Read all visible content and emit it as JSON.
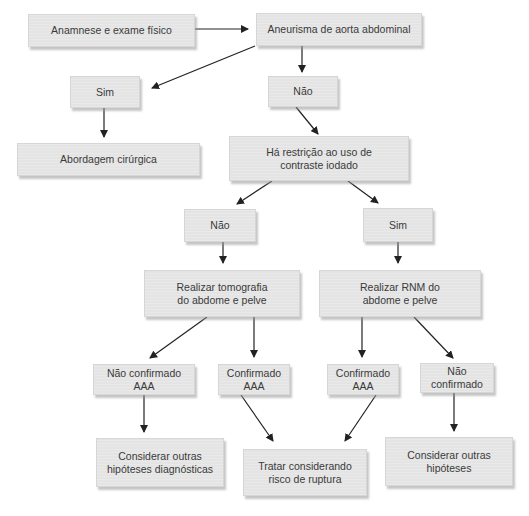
{
  "diagram": {
    "type": "flowchart",
    "language": "pt-BR",
    "nodes": {
      "anamnese": "Anamnese e exame físico",
      "aneurisma": "Aneurisma de aorta abdominal",
      "sim1": "Sim",
      "nao1": "Não",
      "abordagem": "Abordagem cirúrgica",
      "restricao_l1": "Há restrição ao uso de",
      "restricao_l2": "contraste iodado",
      "nao2": "Não",
      "sim2": "Sim",
      "tomografia_l1": "Realizar tomografia",
      "tomografia_l2": "do abdome e pelve",
      "rnm_l1": "Realizar RNM do",
      "rnm_l2": "abdome e pelve",
      "nao_conf_aaa_l1": "Não confirmado",
      "nao_conf_aaa_l2": "AAA",
      "conf_aaa_tc_l1": "Confirmado",
      "conf_aaa_tc_l2": "AAA",
      "conf_aaa_rnm_l1": "Confirmado",
      "conf_aaa_rnm_l2": "AAA",
      "nao_conf_rnm_l1": "Não",
      "nao_conf_rnm_l2": "confirmado",
      "outras_diag_l1": "Considerar outras",
      "outras_diag_l2": "hipóteses diagnósticas",
      "tratar_l1": "Tratar considerando",
      "tratar_l2": "risco de ruptura",
      "outras_l1": "Considerar outras",
      "outras_l2": "hipóteses"
    },
    "edges": [
      [
        "anamnese",
        "aneurisma"
      ],
      [
        "aneurisma",
        "sim1"
      ],
      [
        "aneurisma",
        "nao1"
      ],
      [
        "sim1",
        "abordagem"
      ],
      [
        "nao1",
        "restricao"
      ],
      [
        "restricao",
        "nao2"
      ],
      [
        "restricao",
        "sim2"
      ],
      [
        "nao2",
        "tomografia"
      ],
      [
        "sim2",
        "rnm"
      ],
      [
        "tomografia",
        "nao_conf_aaa"
      ],
      [
        "tomografia",
        "conf_aaa_tc"
      ],
      [
        "rnm",
        "conf_aaa_rnm"
      ],
      [
        "rnm",
        "nao_conf_rnm"
      ],
      [
        "nao_conf_aaa",
        "outras_diag"
      ],
      [
        "conf_aaa_tc",
        "tratar"
      ],
      [
        "conf_aaa_rnm",
        "tratar"
      ],
      [
        "nao_conf_rnm",
        "outras"
      ]
    ],
    "colors": {
      "node_fill": "#e4e4e4",
      "text": "#3a3a3a",
      "arrow": "#222222"
    }
  }
}
